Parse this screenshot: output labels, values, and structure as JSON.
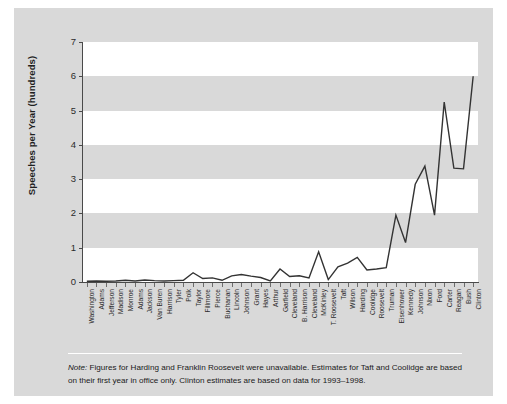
{
  "figure": {
    "note_label": "Note:",
    "note_text": " Figures for Harding and Franklin Roosevelt were unavailable. Estimates for Taft and Coolidge are based on their first year in office only. Clinton estimates are based on data for 1993–1998."
  },
  "chart_data": {
    "type": "line",
    "title": "",
    "xlabel": "",
    "ylabel": "Speeches per Year (hundreds)",
    "ylim": [
      0,
      7
    ],
    "yticks": [
      0,
      1,
      2,
      3,
      4,
      5,
      6,
      7
    ],
    "ytick_labels": [
      "0",
      "1",
      "2",
      "3",
      "4",
      "5",
      "6",
      "7"
    ],
    "grid": false,
    "banded_background": true,
    "legend": null,
    "line_color": "#333333",
    "categories": [
      "Washington",
      "Adams",
      "Jefferson",
      "Madison",
      "Monroe",
      "Adams",
      "Jackson",
      "Van Buren",
      "Harrison",
      "Tyler",
      "Polk",
      "Taylor",
      "Fillmore",
      "Pierce",
      "Buchanan",
      "Lincoln",
      "Johnson",
      "Grant",
      "Hayes",
      "Arthur",
      "Garfield",
      "Cleveland",
      "B. Harrison",
      "Cleveland",
      "McKinley",
      "T. Roosevelt",
      "Taft",
      "Wilson",
      "Harding",
      "Coolidge",
      "Roosevelt",
      "Truman",
      "Eisenhower",
      "Kennedy",
      "Johnson",
      "Nixon",
      "Ford",
      "Carter",
      "Reagan",
      "Bush",
      "Clinton"
    ],
    "values": [
      0.02,
      0.03,
      0.02,
      0.03,
      0.05,
      0.03,
      0.06,
      0.04,
      0.03,
      0.04,
      0.05,
      0.27,
      0.1,
      0.12,
      0.05,
      0.18,
      0.22,
      0.17,
      0.13,
      0.03,
      0.38,
      0.16,
      0.18,
      0.12,
      0.88,
      0.07,
      0.44,
      0.55,
      0.72,
      0.35,
      0.38,
      0.42,
      1.95,
      1.15,
      2.85,
      3.38,
      1.95,
      5.25,
      3.32,
      3.3,
      6.0
    ],
    "series_name": "Speeches per year (hundreds)"
  }
}
